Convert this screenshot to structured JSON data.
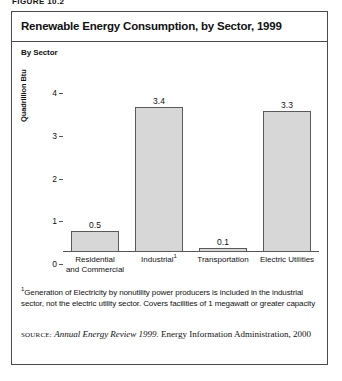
{
  "figure": {
    "caption": "FIGURE 10.2"
  },
  "chart": {
    "title": "Renewable Energy Consumption, by Sector, 1999",
    "subtitle": "By Sector"
  },
  "footnote": {
    "marker": "1",
    "text": "Generation of Electricity by nonutility power producers is included in the industrial sector, not the electric utility sector. Covers facilities of 1 megawatt or greater capacity"
  },
  "source": {
    "label": "source:",
    "title": "Annual Energy Review 1999.",
    "rest": " Energy Information Administration, 2000"
  },
  "colors": {
    "bar_fill": "#d7d7d7",
    "bar_border": "#5a5a5a",
    "frame": "#4a4a4a",
    "text": "#111111"
  },
  "chart_data": {
    "type": "bar",
    "title": "Renewable Energy Consumption, by Sector, 1999",
    "subtitle": "By Sector",
    "xlabel": "",
    "ylabel": "Quadrillion Btu",
    "ylim": [
      0,
      4.4
    ],
    "yticks": [
      0,
      1,
      2,
      3,
      4
    ],
    "ytick_labels": [
      "0",
      "1",
      "2",
      "3",
      "4"
    ],
    "grid": false,
    "legend": false,
    "categories": [
      "Residential and Commercial",
      "Industrial",
      "Transportation",
      "Electric Utilities"
    ],
    "category_label_lines": [
      [
        "Residential",
        "and Commercial"
      ],
      [
        "Industrial"
      ],
      [
        "Transportation"
      ],
      [
        "Electric Utilities"
      ]
    ],
    "category_footnote_markers": [
      "",
      "1",
      "",
      ""
    ],
    "values": [
      0.5,
      3.4,
      0.1,
      3.3
    ],
    "value_labels": [
      "0.5",
      "3.4",
      "0.1",
      "3.3"
    ]
  }
}
